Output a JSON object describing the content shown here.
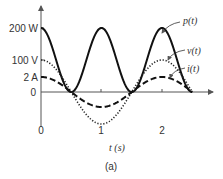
{
  "chart_data": {
    "type": "line",
    "title": "",
    "caption": "(a)",
    "xlabel": "t (s)",
    "ylabel": "",
    "xlim": [
      0,
      2.5
    ],
    "x_ticks": [
      "0",
      "1",
      "2"
    ],
    "y_ticks": [
      "200 W",
      "100 V",
      "2 A",
      "0"
    ],
    "grid": false,
    "series": [
      {
        "name": "p(t)",
        "style": "solid",
        "formula": "200*cos^2(pi*t)",
        "x": [
          0,
          0.5,
          1,
          1.5,
          2,
          2.5
        ],
        "values": [
          200,
          0,
          200,
          0,
          200,
          0
        ]
      },
      {
        "name": "v(t)",
        "style": "dotted",
        "formula": "100*cos(pi*t)",
        "x": [
          0,
          0.5,
          1,
          1.5,
          2,
          2.5
        ],
        "values": [
          100,
          0,
          -100,
          0,
          100,
          0
        ]
      },
      {
        "name": "i(t)",
        "style": "dashed",
        "formula": "2*cos(pi*t)",
        "x": [
          0,
          0.5,
          1,
          1.5,
          2,
          2.5
        ],
        "values": [
          2,
          0,
          -2,
          0,
          2,
          0
        ]
      }
    ]
  },
  "labels": {
    "y200": "200 W",
    "y100": "100 V",
    "y2": "2 A",
    "y0": "0",
    "x0": "0",
    "x1": "1",
    "x2": "2",
    "xlabel": "t (s)",
    "caption": "(a)",
    "p": "p(t)",
    "v": "v(t)",
    "i": "i(t)"
  }
}
